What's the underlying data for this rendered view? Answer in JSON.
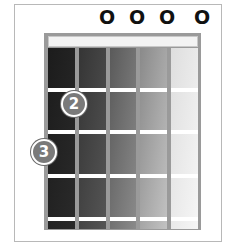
{
  "diagram": {
    "type": "guitar-chord-chart",
    "open_strings": [
      {
        "label": "O",
        "x": 107
      },
      {
        "label": "O",
        "x": 137
      },
      {
        "label": "O",
        "x": 167
      },
      {
        "label": "O",
        "x": 202
      }
    ],
    "fingers": [
      {
        "label": "2",
        "x": 74,
        "y": 104
      },
      {
        "label": "3",
        "x": 44,
        "y": 152
      }
    ],
    "string_columns": [
      {
        "left": 48,
        "width": 27,
        "from": "#1c1c1c",
        "to": "#2a2a2a"
      },
      {
        "left": 79,
        "width": 27,
        "from": "#353535",
        "to": "#555555"
      },
      {
        "left": 110,
        "width": 26,
        "from": "#5a5a5a",
        "to": "#8a8a8a"
      },
      {
        "left": 140,
        "width": 27,
        "from": "#8a8a8a",
        "to": "#c2c2c2"
      },
      {
        "left": 171,
        "width": 27,
        "from": "#dedede",
        "to": "#f6f6f6"
      }
    ],
    "fret_lines_y": [
      88,
      130,
      174,
      217
    ]
  }
}
